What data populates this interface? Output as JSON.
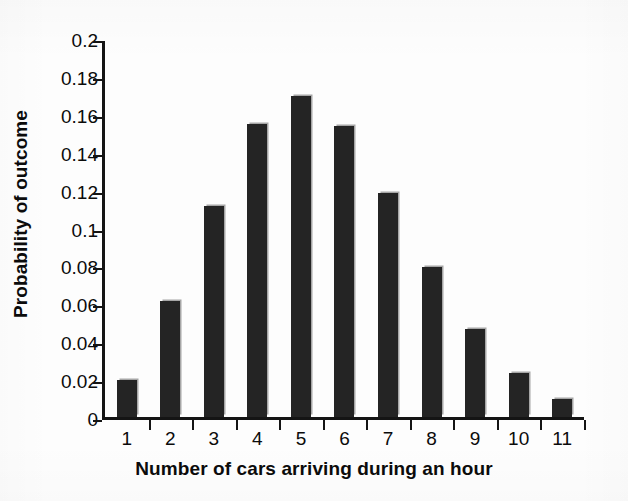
{
  "chart_data": {
    "type": "bar",
    "title": "",
    "xlabel": "Number of cars arriving during an hour",
    "ylabel": "Probability of outcome",
    "categories": [
      "1",
      "2",
      "3",
      "4",
      "5",
      "6",
      "7",
      "8",
      "9",
      "10",
      "11"
    ],
    "values": [
      0.021,
      0.063,
      0.113,
      0.156,
      0.171,
      0.155,
      0.12,
      0.081,
      0.048,
      0.025,
      0.011
    ],
    "ylim": [
      0,
      0.2
    ],
    "y_ticks": [
      0,
      0.02,
      0.04,
      0.06,
      0.08,
      0.1,
      0.12,
      0.14,
      0.16,
      0.18,
      0.2
    ],
    "y_tick_labels": [
      "0",
      "0.02",
      "0.04",
      "0.06",
      "0.08",
      "0.1",
      "0.12",
      "0.14",
      "0.16",
      "0.18",
      "0.2"
    ],
    "grid": false,
    "legend": false,
    "legend_position": "none",
    "bar_color": "#242424",
    "axis_color": "#141414",
    "background_color": "#fdfdfd",
    "text_color": "#0b0b0b"
  }
}
